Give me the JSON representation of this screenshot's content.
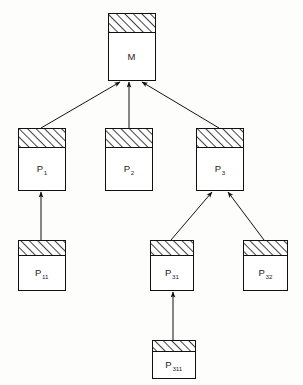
{
  "diagram": {
    "type": "tree",
    "background_color": "#fdfdfc",
    "line_color": "#111111",
    "box_fill": "#ffffff",
    "hatch_color": "#111111",
    "nodes": [
      {
        "id": "M",
        "label": "M",
        "subscript": "",
        "x": 108,
        "y": 13,
        "w": 47,
        "h": 67,
        "head_h": 19,
        "level": 0
      },
      {
        "id": "P1",
        "label": "P",
        "subscript": "1",
        "x": 18,
        "y": 128,
        "w": 47,
        "h": 62,
        "head_h": 19,
        "level": 1
      },
      {
        "id": "P2",
        "label": "P",
        "subscript": "2",
        "x": 105,
        "y": 128,
        "w": 47,
        "h": 62,
        "head_h": 19,
        "level": 1
      },
      {
        "id": "P3",
        "label": "P",
        "subscript": "3",
        "x": 196,
        "y": 128,
        "w": 47,
        "h": 62,
        "head_h": 19,
        "level": 1
      },
      {
        "id": "P11",
        "label": "P",
        "subscript": "11",
        "x": 18,
        "y": 240,
        "w": 47,
        "h": 50,
        "head_h": 15,
        "level": 2
      },
      {
        "id": "P31",
        "label": "P",
        "subscript": "31",
        "x": 150,
        "y": 240,
        "w": 43,
        "h": 50,
        "head_h": 15,
        "level": 2
      },
      {
        "id": "P32",
        "label": "P",
        "subscript": "32",
        "x": 243,
        "y": 240,
        "w": 44,
        "h": 50,
        "head_h": 15,
        "level": 2
      },
      {
        "id": "P311",
        "label": "P",
        "subscript": "311",
        "x": 152,
        "y": 340,
        "w": 43,
        "h": 38,
        "head_h": 11,
        "level": 3
      }
    ],
    "edges": [
      {
        "id": "P1-M",
        "from": "P1",
        "to": "M",
        "x1": 41,
        "y1": 128,
        "x2": 120,
        "y2": 82,
        "kind": "diagonal"
      },
      {
        "id": "P2-M",
        "from": "P2",
        "to": "M",
        "x1": 129,
        "y1": 128,
        "x2": 129,
        "y2": 82,
        "kind": "vertical"
      },
      {
        "id": "P3-M",
        "from": "P3",
        "to": "M",
        "x1": 219,
        "y1": 128,
        "x2": 142,
        "y2": 82,
        "kind": "diagonal"
      },
      {
        "id": "P11-P1",
        "from": "P11",
        "to": "P1",
        "x1": 41,
        "y1": 240,
        "x2": 41,
        "y2": 192,
        "kind": "vertical"
      },
      {
        "id": "P31-P3",
        "from": "P31",
        "to": "P3",
        "x1": 171,
        "y1": 240,
        "x2": 212,
        "y2": 192,
        "kind": "diagonal"
      },
      {
        "id": "P32-P3",
        "from": "P32",
        "to": "P3",
        "x1": 264,
        "y1": 240,
        "x2": 228,
        "y2": 192,
        "kind": "diagonal"
      },
      {
        "id": "P311-P31",
        "from": "P311",
        "to": "P31",
        "x1": 173,
        "y1": 340,
        "x2": 173,
        "y2": 292,
        "kind": "vertical"
      }
    ]
  }
}
